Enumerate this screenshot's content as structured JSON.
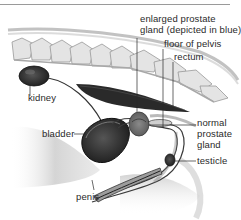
{
  "diagram": {
    "type": "anatomical-illustration",
    "accent_color": "#4a4a4a",
    "labels": [
      {
        "id": "enlarged-prostate",
        "text": "enlarged prostate\ngland (depicted in blue)"
      },
      {
        "id": "floor-of-pelvis",
        "text": "floor of pelvis"
      },
      {
        "id": "rectum",
        "text": "rectum"
      },
      {
        "id": "kidney",
        "text": "kidney"
      },
      {
        "id": "bladder",
        "text": "bladder"
      },
      {
        "id": "normal-prostate",
        "text": "normal\nprostate\ngland"
      },
      {
        "id": "testicle",
        "text": "testicle"
      },
      {
        "id": "penis",
        "text": "penis"
      }
    ]
  }
}
